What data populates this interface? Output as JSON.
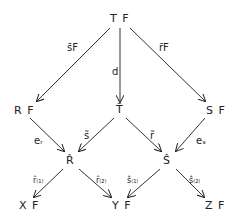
{
  "diagram": {
    "nodes": {
      "TF": "T F",
      "RF": "R F",
      "Tbar": "T̃",
      "SF": "S F",
      "Rhat": "R̂",
      "Shat": "Ŝ",
      "XF": "X F",
      "YF": "Y F",
      "ZF": "Z F"
    },
    "edges": {
      "TF_RF": "s̄F",
      "TF_Tbar": "d",
      "TF_SF": "r̄F",
      "RF_Rhat": "eᵣ",
      "Tbar_Rhat": "s̃",
      "Tbar_Shat": "r̃",
      "SF_Shat": "eₛ",
      "Rhat_XF": "r̂₍₁₎",
      "Rhat_YF": "r̂₍₂₎",
      "Shat_YF": "ŝ₍₁₎",
      "Shat_ZF": "ŝ₍₂₎"
    }
  }
}
